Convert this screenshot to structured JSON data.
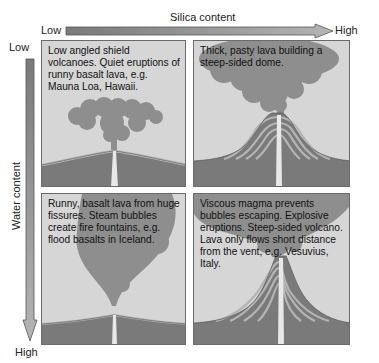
{
  "x_axis": {
    "title": "Silica content",
    "low_label": "Low",
    "high_label": "High"
  },
  "y_axis": {
    "title": "Water content",
    "low_label": "Low",
    "high_label": "High"
  },
  "panels": [
    {
      "position": "top-left",
      "caption": "Low angled shield volcanoes. Quiet eruptions of runny basalt lava, e.g. Mauna Loa, Hawaii."
    },
    {
      "position": "top-right",
      "caption": "Thick, pasty lava building a steep-sided dome."
    },
    {
      "position": "bottom-left",
      "caption": "Runny, basalt lava from huge fissures. Steam bubbles create fire fountains, e.g. flood basalts in Iceland."
    },
    {
      "position": "bottom-right",
      "caption": "Viscous magma prevents bubbles escaping. Explosive eruptions. Steep-sided volcano. Lava only flows short distance from the vent, e.g. Vesuvius, Italy."
    }
  ],
  "colors": {
    "sky": "#d6d6d6",
    "ash_cloud": "#8e8e8e",
    "ground": "#7a7a7a",
    "lava_light": "#b0b0b0",
    "lava_dark": "#8a8a8a",
    "vent": "#e8e8e8",
    "arrow_fill": "#8c8c8c"
  }
}
